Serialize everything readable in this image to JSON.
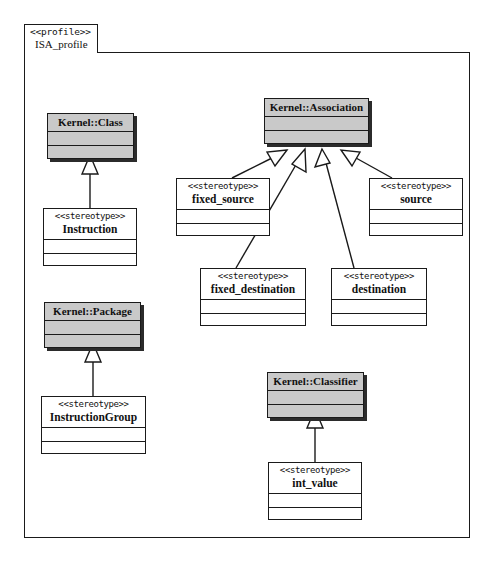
{
  "diagram": {
    "kind": "uml-profile-diagram",
    "frame": {
      "keyword": "<<profile>>",
      "name": "ISA_profile"
    },
    "metaclasses": [
      {
        "id": "kernel-class",
        "name": "Kernel::Class"
      },
      {
        "id": "kernel-association",
        "name": "Kernel::Association"
      },
      {
        "id": "kernel-package",
        "name": "Kernel::Package"
      },
      {
        "id": "kernel-classifier",
        "name": "Kernel::Classifier"
      }
    ],
    "stereotypes": [
      {
        "id": "instruction",
        "keyword": "<<stereotype>>",
        "name": "Instruction"
      },
      {
        "id": "fixed-source",
        "keyword": "<<stereotype>>",
        "name": "fixed_source"
      },
      {
        "id": "source",
        "keyword": "<<stereotype>>",
        "name": "source"
      },
      {
        "id": "fixed-destination",
        "keyword": "<<stereotype>>",
        "name": "fixed_destination"
      },
      {
        "id": "destination",
        "keyword": "<<stereotype>>",
        "name": "destination"
      },
      {
        "id": "instruction-group",
        "keyword": "<<stereotype>>",
        "name": "InstructionGroup"
      },
      {
        "id": "int-value",
        "keyword": "<<stereotype>>",
        "name": "int_value"
      }
    ],
    "extensions": [
      {
        "from": "instruction",
        "to": "kernel-class"
      },
      {
        "from": "fixed-source",
        "to": "kernel-association"
      },
      {
        "from": "fixed-destination",
        "to": "kernel-association"
      },
      {
        "from": "destination",
        "to": "kernel-association"
      },
      {
        "from": "source",
        "to": "kernel-association"
      },
      {
        "from": "instruction-group",
        "to": "kernel-package"
      },
      {
        "from": "int-value",
        "to": "kernel-classifier"
      }
    ],
    "colors": {
      "metaclass_fill": "#c9c9c9",
      "stereotype_fill": "#ffffff",
      "line": "#1a1a1a",
      "shadow": "#2b2b2b",
      "background": "#ffffff"
    }
  }
}
